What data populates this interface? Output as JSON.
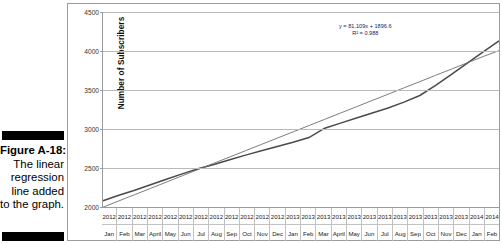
{
  "caption": {
    "figure_label": "Figure A-18:",
    "lines": [
      "The linear",
      "regression",
      "line added",
      "to the graph."
    ]
  },
  "chart_data": {
    "type": "line",
    "title": "",
    "xlabel": "",
    "ylabel": "Number of Subscribers",
    "ylim": [
      2000,
      4500
    ],
    "yticks": [
      2000,
      2500,
      3000,
      3500,
      4000,
      4500
    ],
    "grid": true,
    "legend": "none",
    "annotations": {
      "equation": "y = 81.109x + 1896.6",
      "r_squared": "R² = 0.988"
    },
    "categories": [
      "Jan 2012",
      "Feb 2012",
      "Mar 2012",
      "April 2012",
      "May 2012",
      "Jun 2012",
      "Jul 2012",
      "Aug 2012",
      "Sep 2012",
      "Oct 2012",
      "Nov 2012",
      "Dec 2012",
      "Jan 2013",
      "Feb 2013",
      "Mar 2013",
      "April 2013",
      "May 2013",
      "Jun 2013",
      "Jul 2013",
      "Aug 2013",
      "Sep 2013",
      "Oct 2013",
      "Nov 2013",
      "Dec 2013",
      "Jan 2014",
      "Feb 2014"
    ],
    "x_axis_rows": {
      "years": [
        "2012",
        "2012",
        "2012",
        "2012",
        "2012",
        "2012",
        "2012",
        "2012",
        "2012",
        "2012",
        "2012",
        "2012",
        "2013",
        "2013",
        "2013",
        "2013",
        "2013",
        "2013",
        "2013",
        "2013",
        "2013",
        "2013",
        "2013",
        "2013",
        "2014",
        "2014"
      ],
      "months": [
        "Jan",
        "Feb",
        "Mar",
        "April",
        "May",
        "Jun",
        "Jul",
        "Aug",
        "Sep",
        "Oct",
        "Nov",
        "Dec",
        "Jan",
        "Feb",
        "Mar",
        "April",
        "May",
        "Jun",
        "Jul",
        "Aug",
        "Sep",
        "Oct",
        "Nov",
        "Dec",
        "Jan",
        "Feb"
      ]
    },
    "series": [
      {
        "name": "Number of Subscribers",
        "color": "#4a4a4a",
        "values": [
          2080,
          2150,
          2215,
          2285,
          2355,
          2425,
          2490,
          2545,
          2605,
          2665,
          2720,
          2775,
          2830,
          2890,
          3010,
          3075,
          3140,
          3205,
          3270,
          3345,
          3430,
          3560,
          3700,
          3845,
          3990,
          4130
        ]
      },
      {
        "name": "Linear regression line",
        "color": "#6e6e6e",
        "values": [
          1998,
          2078,
          2158,
          2239,
          2319,
          2400,
          2480,
          2561,
          2641,
          2722,
          2802,
          2883,
          2963,
          3044,
          3124,
          3205,
          3285,
          3366,
          3446,
          3527,
          3607,
          3688,
          3768,
          3849,
          3929,
          4005
        ]
      }
    ]
  }
}
